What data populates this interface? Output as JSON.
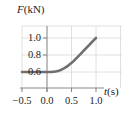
{
  "figure": {
    "name": "force-vs-time-graph",
    "background_color": "#ffffff"
  },
  "chart_data": {
    "type": "line",
    "title": "",
    "subtitle": "",
    "xlabel": "t(s)",
    "ylabel": "F(kN)",
    "xlabel_symbol": "t",
    "xlabel_unit": "(s)",
    "ylabel_symbol": "F",
    "ylabel_unit": "(kN)",
    "xlim": [
      -0.5,
      1.25
    ],
    "ylim": [
      0.5,
      1.08
    ],
    "xticks": [
      -0.5,
      0.0,
      0.5,
      1.0
    ],
    "xticklabels": [
      "−0.5",
      "0.0",
      "0.5",
      "1.0"
    ],
    "yticks": [
      0.6,
      0.8,
      1.0
    ],
    "yticklabels": [
      "0.6",
      "0.8",
      "1.0"
    ],
    "grid": true,
    "grid_color": "#d8d8d8",
    "legend": null,
    "legend_position": "none",
    "axis_color": "#8a8a8a",
    "series": [
      {
        "name": "force",
        "color": "#6f6f6f",
        "linewidth": 2.6,
        "x": [
          -0.5,
          -0.4,
          -0.3,
          -0.2,
          -0.1,
          0.0,
          0.05,
          0.1,
          0.15,
          0.2,
          0.25,
          0.3,
          0.35,
          0.4,
          0.45,
          0.5,
          0.55,
          0.6,
          0.65,
          0.7,
          0.75,
          0.8,
          0.85,
          0.9,
          0.95,
          1.0
        ],
        "y": [
          0.6,
          0.6,
          0.6,
          0.6,
          0.6,
          0.6,
          0.6,
          0.601,
          0.603,
          0.608,
          0.616,
          0.627,
          0.642,
          0.66,
          0.681,
          0.705,
          0.731,
          0.76,
          0.79,
          0.82,
          0.851,
          0.881,
          0.911,
          0.941,
          0.971,
          1.0
        ]
      }
    ],
    "annotations": []
  },
  "ticks": {
    "x": [
      {
        "label": "−0.5",
        "value": -0.5
      },
      {
        "label": "0.0",
        "value": 0.0
      },
      {
        "label": "0.5",
        "value": 0.5
      },
      {
        "label": "1.0",
        "value": 1.0
      }
    ],
    "y": [
      {
        "label": "1.0",
        "value": 1.0
      },
      {
        "label": "0.8",
        "value": 0.8
      },
      {
        "label": "0.6",
        "value": 0.6
      }
    ]
  }
}
